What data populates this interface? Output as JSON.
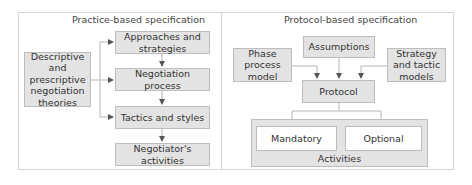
{
  "left_panel": {
    "title": "Practice-based specification",
    "source_box": "Descriptive and prescriptive negotiation theories",
    "chain": [
      "Approaches and strategies",
      "Negotiation process",
      "Tactics and styles",
      "Negotiator's activities"
    ]
  },
  "right_panel": {
    "title": "Protocol-based specification",
    "inputs": {
      "left": "Phase process model",
      "top": "Assumptions",
      "right": "Strategy and tactic models"
    },
    "protocol": "Protocol",
    "activities": {
      "label": "Activities",
      "items": [
        "Mandatory",
        "Optional"
      ]
    }
  },
  "colors": {
    "box_fill": "#e3e3e3",
    "box_border": "#bdbdbd",
    "arrow": "#555555",
    "frame": "#d6d6d6"
  }
}
